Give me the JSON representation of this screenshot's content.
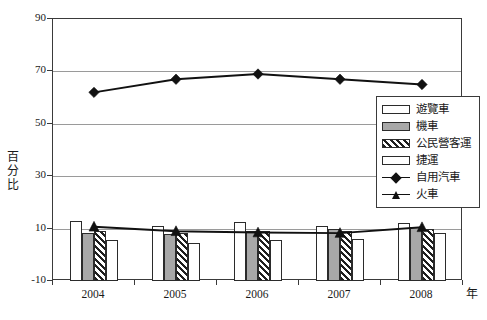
{
  "chart_data": {
    "type": "bar",
    "title": "",
    "subtitle": "",
    "xlabel": "年",
    "ylabel": "百分比",
    "categories": [
      "2004",
      "2005",
      "2006",
      "2007",
      "2008"
    ],
    "ylim": [
      -10,
      90
    ],
    "yticks": [
      "-10",
      "10",
      "30",
      "50",
      "70",
      "90"
    ],
    "ytick_values": [
      -10,
      10,
      30,
      50,
      70,
      90
    ],
    "grid": true,
    "legend_position": "right-inside",
    "series": [
      {
        "name": "遊覽車",
        "kind": "bar",
        "pattern": "dots",
        "values": [
          13.0,
          11.0,
          12.5,
          11.0,
          12.0
        ]
      },
      {
        "name": "機車",
        "kind": "bar",
        "pattern": "gray",
        "values": [
          8.5,
          8.0,
          9.0,
          10.0,
          10.5
        ]
      },
      {
        "name": "公民營客運",
        "kind": "bar",
        "pattern": "hatch",
        "values": [
          9.0,
          8.5,
          9.0,
          9.0,
          10.0
        ]
      },
      {
        "name": "捷運",
        "kind": "bar",
        "pattern": "white",
        "values": [
          5.7,
          4.5,
          5.5,
          6.2,
          8.5
        ]
      },
      {
        "name": "自用汽車",
        "kind": "line",
        "marker": "diamond",
        "values": [
          62.0,
          67.0,
          69.0,
          67.0,
          65.0
        ]
      },
      {
        "name": "火車",
        "kind": "line",
        "marker": "triangle",
        "values": [
          10.7,
          9.0,
          8.5,
          8.3,
          10.5
        ]
      }
    ]
  },
  "axes": {
    "y_title_chars": [
      "百",
      "分",
      "比"
    ],
    "x_title": "年"
  },
  "legend": {
    "entries": [
      {
        "label": "遊覽車",
        "key": "bar-dots"
      },
      {
        "label": "機車",
        "key": "bar-gray"
      },
      {
        "label": "公民營客運",
        "key": "bar-hatch"
      },
      {
        "label": "捷運",
        "key": "bar-white"
      },
      {
        "label": "自用汽車",
        "key": "line-diamond"
      },
      {
        "label": "火車",
        "key": "line-triangle"
      }
    ]
  },
  "colors": {
    "axis": "#3a3a3a",
    "gridline": "#9a9a9a",
    "bar_outline": "#2b2b2b",
    "bar_gray_fill": "#a8a8a8",
    "line": "#111111",
    "background": "#ffffff",
    "text": "#1a1a1a"
  }
}
